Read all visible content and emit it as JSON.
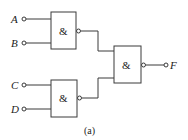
{
  "diagram": {
    "caption": "(a)",
    "inputs": [
      {
        "id": "A",
        "label": "A"
      },
      {
        "id": "B",
        "label": "B"
      },
      {
        "id": "C",
        "label": "C"
      },
      {
        "id": "D",
        "label": "D"
      }
    ],
    "output": {
      "id": "F",
      "label": "F"
    },
    "gates": [
      {
        "id": "g1",
        "symbol": "&",
        "type": "NAND",
        "inputs": [
          "A",
          "B"
        ]
      },
      {
        "id": "g2",
        "symbol": "&",
        "type": "NAND",
        "inputs": [
          "C",
          "D"
        ]
      },
      {
        "id": "g3",
        "symbol": "&",
        "type": "NAND",
        "inputs": [
          "g1",
          "g2"
        ],
        "output": "F"
      }
    ],
    "colors": {
      "line": "#3a3a3a",
      "background": "#ffffff"
    }
  }
}
